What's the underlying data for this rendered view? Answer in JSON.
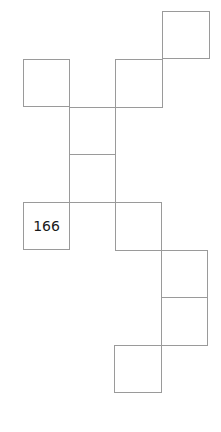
{
  "diagram": {
    "type": "grid-net",
    "line_color": "#9a9a9a",
    "cell_size": 47,
    "cells": [
      {
        "id": "c1",
        "x": 162,
        "y": 11,
        "label": ""
      },
      {
        "id": "c2",
        "x": 23,
        "y": 59,
        "label": ""
      },
      {
        "id": "c3",
        "x": 115,
        "y": 59,
        "label": ""
      },
      {
        "id": "c4",
        "x": 69,
        "y": 107,
        "label": ""
      },
      {
        "id": "c5",
        "x": 69,
        "y": 154,
        "label": ""
      },
      {
        "id": "c6",
        "x": 23,
        "y": 202,
        "label": "166"
      },
      {
        "id": "c7",
        "x": 115,
        "y": 202,
        "label": ""
      },
      {
        "id": "c8",
        "x": 161,
        "y": 250,
        "label": ""
      },
      {
        "id": "c9",
        "x": 161,
        "y": 297,
        "label": ""
      },
      {
        "id": "c10",
        "x": 114,
        "y": 345,
        "label": ""
      }
    ]
  }
}
